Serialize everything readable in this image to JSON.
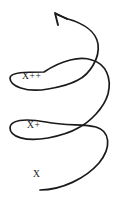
{
  "figure": {
    "type": "hand-drawn-spiral-diagram",
    "background_color": "#ffffff",
    "stroke_color": "#1a1a1a",
    "width": 119,
    "height": 206,
    "direction": "upward-counterclockwise",
    "arrow": {
      "name": "arrowhead",
      "tip_x": 55,
      "tip_y": 13,
      "points": "up-left"
    },
    "labels": [
      {
        "id": "x",
        "text": "X",
        "x": 33,
        "y": 170,
        "loop": "bottom-tail"
      },
      {
        "id": "x_plus",
        "text": "X+",
        "x": 27,
        "y": 121,
        "loop": "middle-loop"
      },
      {
        "id": "x_plus_plus",
        "text": "X++",
        "x": 22,
        "y": 72,
        "loop": "upper-loop"
      }
    ],
    "loops": [
      {
        "id": "upper-loop",
        "left": 9,
        "right": 78,
        "top": 62,
        "bottom": 93
      },
      {
        "id": "middle-loop",
        "left": 9,
        "right": 78,
        "top": 112,
        "bottom": 142
      }
    ],
    "crossings": [
      {
        "id": "upper-crossing",
        "x": 78,
        "y": 80
      },
      {
        "id": "lower-crossing",
        "x": 78,
        "y": 128
      }
    ],
    "paths": {
      "spiral": "M 40,190 C 62,190 86,178 99,163 C 112,147 110,131 96,127 C 84,124 66,126 46,122 C 24,118 10,120 10,128 C 10,137 26,142 48,138 C 68,134 78,128 78,128 C 90,122 104,108 108,94 C 112,78 106,64 92,60 C 80,56 62,60 44,72 C 26,72 10,72 10,78 C 10,86 26,93 48,89 C 70,85 78,80 78,80 C 90,74 100,58 98,44 C 96,31 82,23 68,19 C 64,17.6 60,16 57,14.6",
      "arrowhead": "M 55,13 L 67,19 M 55,13 L 58,25"
    }
  }
}
